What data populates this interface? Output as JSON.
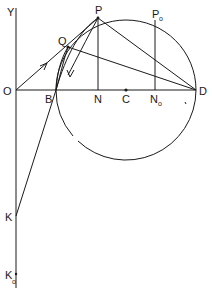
{
  "diagram": {
    "type": "geometry",
    "labels": {
      "Y": "Y",
      "O": "O",
      "B": "B",
      "N": "N",
      "C": "C",
      "N0": "N",
      "N0_sub": "o",
      "D": "D",
      "P": "P",
      "P0": "P",
      "P0_sub": "o",
      "Q": "Q",
      "K": "K",
      "K0": "K",
      "K0_sub": "o"
    },
    "points": {
      "O": [
        16,
        90
      ],
      "B": [
        56,
        90
      ],
      "N": [
        98,
        90
      ],
      "C": [
        126,
        90
      ],
      "N0": [
        155,
        90
      ],
      "D": [
        196,
        90
      ],
      "P": [
        98,
        18
      ],
      "P0": [
        155,
        22
      ],
      "Q": [
        68,
        47
      ],
      "K": [
        16,
        216
      ],
      "K0": [
        16,
        274
      ]
    },
    "circle": {
      "center": "C",
      "radius": 70,
      "note": "arc through B and D, with a gap in the lower-left"
    },
    "segments": [
      [
        "O",
        "D"
      ],
      [
        "O",
        "Q"
      ],
      [
        "Q",
        "D"
      ],
      [
        "P",
        "D"
      ],
      [
        "P",
        "N"
      ],
      [
        "P0",
        "N0"
      ],
      [
        "B",
        "K"
      ],
      [
        "Y-axis top",
        "K0"
      ]
    ]
  }
}
